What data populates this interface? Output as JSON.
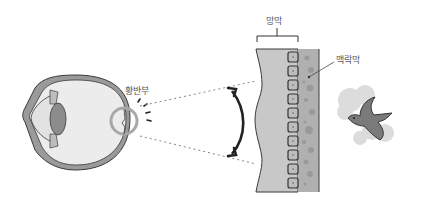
{
  "labels": {
    "macula": "황반부",
    "retina": "망막",
    "choroid": "맥락막"
  },
  "colors": {
    "outline": "#3a3a3a",
    "wall": "#9a9a9a",
    "interior": "#ececec",
    "lens": "#8c8c8c",
    "retina_layer": "#c8c8c8",
    "choroid_layer": "#b0b0b0",
    "bird": "#7a7a7a",
    "cloud": "#dcdcdc",
    "arrow": "#222222"
  }
}
